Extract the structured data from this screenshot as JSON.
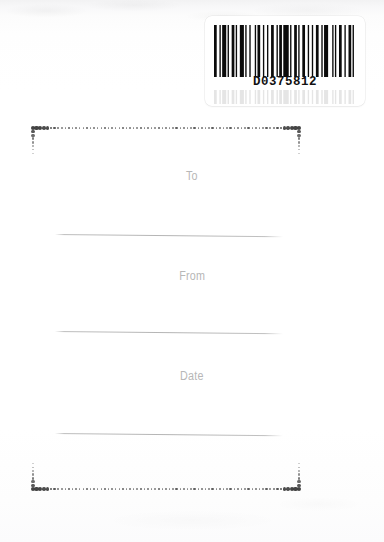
{
  "card": {
    "type": "gift-tag-card",
    "background_color": "#fefefe"
  },
  "barcode": {
    "name": "barcode-label",
    "number": "D0375812",
    "symbology_look": "code-39",
    "bar_color": "#0b0b0b",
    "label_background": "#ffffff",
    "bar_pattern": [
      3,
      2,
      1,
      2,
      3,
      2,
      1,
      3,
      2,
      2,
      1,
      2,
      4,
      2,
      1,
      2,
      2,
      3,
      1,
      2,
      3,
      2,
      2,
      2,
      1,
      3,
      3,
      2,
      1,
      2,
      2,
      2,
      4,
      2,
      1,
      3,
      2,
      2,
      1,
      2,
      3,
      3,
      1,
      2,
      2,
      2,
      3,
      2,
      1,
      2,
      4,
      3,
      1,
      2,
      2,
      2,
      3,
      2,
      1,
      3,
      2,
      2,
      1,
      2
    ]
  },
  "frame": {
    "name": "dotted-decorative-frame",
    "dot_color": "#3a3a3a",
    "top_y": 128,
    "bottom_y": 489,
    "left_x": 33,
    "right_x": 299,
    "corner_tail_length": 26,
    "note": "large dots at corners tapering to small dots along each run"
  },
  "fields": [
    {
      "id": "to",
      "label": "To",
      "label_y": 174,
      "rule_y": 234,
      "label_color": "#b7b7b7"
    },
    {
      "id": "from",
      "label": "From",
      "label_y": 274,
      "rule_y": 331,
      "label_color": "#b7b7b7"
    },
    {
      "id": "date",
      "label": "Date",
      "label_y": 374,
      "rule_y": 433,
      "label_color": "#b7b7b7"
    }
  ],
  "rule_style": {
    "color": "#b4b4b4",
    "left_x": 55,
    "width": 228,
    "thickness": 1
  }
}
